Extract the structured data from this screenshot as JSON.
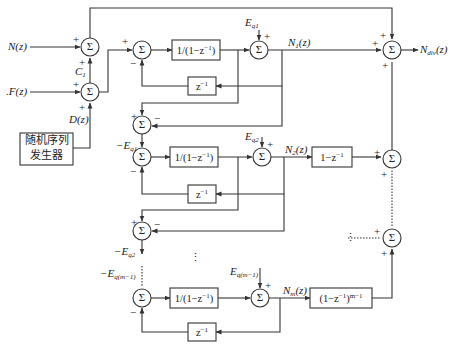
{
  "inputs": {
    "n": "N(z)",
    "f": ".F(z)",
    "d": "D(z)",
    "c1": "C",
    "c1_sub": "1"
  },
  "random_generator": {
    "line1": "随机序列",
    "line2": "发生器"
  },
  "sum_symbol": "Σ",
  "signs": {
    "plus": "+",
    "minus": "−"
  },
  "blocks": {
    "integrator": "1/(1−z",
    "integrator_sup": "−1",
    "integrator_close": ")",
    "delay": "z",
    "delay_sup": "−1",
    "diff1": "1−z",
    "diff1_sup": "−1",
    "diffm": "(1−z",
    "diffm_sup1": "−1",
    "diffm_mid": ")",
    "diffm_sup2": "m−1"
  },
  "stage_labels": {
    "eq1": "E",
    "eq1_sub": "q1",
    "eq2": "E",
    "eq2_sub": "q2",
    "eqm1": "E",
    "eqm1_sub": "q(m−1)",
    "neg_eq1": "−E",
    "neg_eq1_sub": "q1",
    "neg_eq2": "−E",
    "neg_eq2_sub": "q2",
    "neg_eqm1": "−E",
    "neg_eqm1_sub": "q(m−1)",
    "n1": "N",
    "n1_sub": "1",
    "n_tail": "(z)",
    "n2": "N",
    "n2_sub": "2",
    "nm": "N",
    "nm_sub": "m"
  },
  "output": {
    "label": "N",
    "sub": "div",
    "tail": "(z)"
  },
  "ellipsis": "⋮"
}
